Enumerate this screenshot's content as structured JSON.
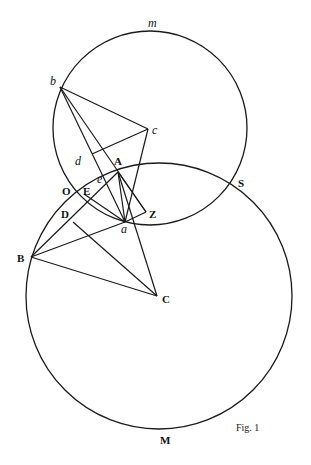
{
  "figure": {
    "caption": "Fig. 1",
    "circles": [
      {
        "name": "upper-circle",
        "label": "m",
        "center_point": "c"
      },
      {
        "name": "lower-circle",
        "label": "M",
        "center_point": "C"
      }
    ],
    "points": [
      {
        "id": "b",
        "label": "b",
        "style": "italic"
      },
      {
        "id": "c",
        "label": "c",
        "style": "italic"
      },
      {
        "id": "d",
        "label": "d",
        "style": "italic"
      },
      {
        "id": "e",
        "label": "e",
        "style": "italic"
      },
      {
        "id": "a",
        "label": "a",
        "style": "italic"
      },
      {
        "id": "A",
        "label": "A",
        "style": "upright"
      },
      {
        "id": "O",
        "label": "O",
        "style": "upright"
      },
      {
        "id": "E",
        "label": "E",
        "style": "upright"
      },
      {
        "id": "D",
        "label": "D",
        "style": "upright"
      },
      {
        "id": "Z",
        "label": "Z",
        "style": "upright"
      },
      {
        "id": "B",
        "label": "B",
        "style": "upright"
      },
      {
        "id": "C",
        "label": "C",
        "style": "upright"
      },
      {
        "id": "S",
        "label": "S",
        "style": "upright"
      },
      {
        "id": "m",
        "label": "m",
        "style": "italic"
      },
      {
        "id": "M",
        "label": "M",
        "style": "upright"
      }
    ],
    "segments": [
      [
        "b",
        "c"
      ],
      [
        "b",
        "a"
      ],
      [
        "b",
        "Z"
      ],
      [
        "d",
        "c"
      ],
      [
        "c",
        "a"
      ],
      [
        "A",
        "a"
      ],
      [
        "A",
        "Z"
      ],
      [
        "A",
        "C"
      ],
      [
        "B",
        "A"
      ],
      [
        "B",
        "a"
      ],
      [
        "B",
        "C"
      ],
      [
        "D",
        "C"
      ],
      [
        "a",
        "C"
      ],
      [
        "O",
        "a"
      ],
      [
        "E",
        "a"
      ],
      [
        "a",
        "Z"
      ]
    ]
  }
}
